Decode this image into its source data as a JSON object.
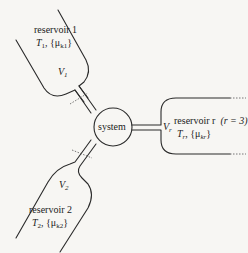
{
  "diagram": {
    "type": "thermodynamic-system-with-reservoirs",
    "colors": {
      "line": "#2a2a2a",
      "background": "#f7f6f3",
      "dashed_wall": "#555555"
    },
    "system": {
      "label": "system"
    },
    "reservoirs": [
      {
        "id": "reservoir-1",
        "name": "reservoir 1",
        "temperature_label": "T",
        "temperature_sub": "1",
        "mu_label": "{μ",
        "mu_sub": "k1",
        "mu_close": "}",
        "volume_label": "V",
        "volume_sub": "1"
      },
      {
        "id": "reservoir-2",
        "name": "reservoir 2",
        "temperature_label": "T",
        "temperature_sub": "2",
        "mu_label": "{μ",
        "mu_sub": "k2",
        "mu_close": "}",
        "volume_label": "V",
        "volume_sub": "2"
      },
      {
        "id": "reservoir-r",
        "name": "reservoir r",
        "annotation": "(r = 3)",
        "temperature_label": "T",
        "temperature_sub": "r",
        "mu_label": "{μ",
        "mu_sub": "kr",
        "mu_close": "}",
        "volume_label": "V",
        "volume_sub": "r"
      }
    ]
  }
}
